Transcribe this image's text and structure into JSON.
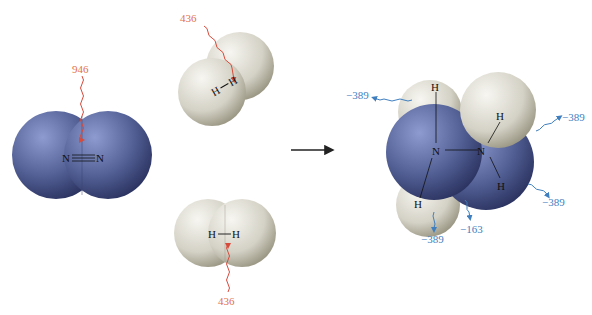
{
  "diagram": {
    "title": "",
    "reactants": {
      "n2": {
        "atoms": [
          "N",
          "N"
        ],
        "bond_label": "N≡N",
        "energy": "946"
      },
      "h2_top": {
        "atoms": [
          "H",
          "H"
        ],
        "energy": "436"
      },
      "h2_bottom": {
        "atoms": [
          "H",
          "H"
        ],
        "energy": "436"
      }
    },
    "reaction_arrow": "right-arrow",
    "product": {
      "name": "hydrazine",
      "atoms": {
        "n_left": "N",
        "n_right": "N",
        "h_top_left": "H",
        "h_top_right": "H",
        "h_bottom_left": "H",
        "h_bottom_right": "H"
      },
      "energies": {
        "top_left": "−389",
        "right_top": "−389",
        "right_bottom": "−389",
        "bottom_left": "−389",
        "bottom_nn": "−163"
      }
    },
    "colors": {
      "nitrogen": "#5a6a9e",
      "hydrogen": "#d8d6cc",
      "energy_in": "#e2704a",
      "energy_out": "#3f7fbf"
    }
  }
}
